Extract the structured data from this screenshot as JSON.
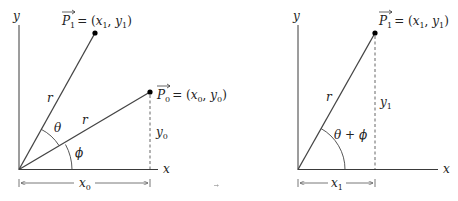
{
  "left_diagram": {
    "axis_x_label": "x",
    "axis_y_label": "y",
    "point_p1": {
      "name": "P",
      "sub": "1",
      "eq": "= (",
      "x": "x",
      "xsub": "1",
      "comma": ", ",
      "y": "y",
      "ysub": "1",
      "close": ")"
    },
    "point_p0": {
      "name": "P",
      "sub": "0",
      "eq": "= (",
      "x": "x",
      "xsub": "0",
      "comma": ", ",
      "y": "y",
      "ysub": "0",
      "close": ")"
    },
    "radius_label_upper": "r",
    "radius_label_lower": "r",
    "angle_theta": "θ",
    "angle_phi": "ϕ",
    "height_label": {
      "base": "y",
      "sub": "0"
    },
    "width_label": {
      "base": "x",
      "sub": "0"
    }
  },
  "right_diagram": {
    "axis_x_label": "x",
    "axis_y_label": "y",
    "point_p1": {
      "name": "P",
      "sub": "1",
      "eq": "= (",
      "x": "x",
      "xsub": "1",
      "comma": ", ",
      "y": "y",
      "ysub": "1",
      "close": ")"
    },
    "radius_label": "r",
    "angle_label": "θ + ϕ",
    "height_label": {
      "base": "y",
      "sub": "1"
    },
    "width_label": {
      "base": "x",
      "sub": "1"
    }
  },
  "colors": {
    "line": "#3a3a3a",
    "point": "#000000",
    "background": "#ffffff"
  }
}
